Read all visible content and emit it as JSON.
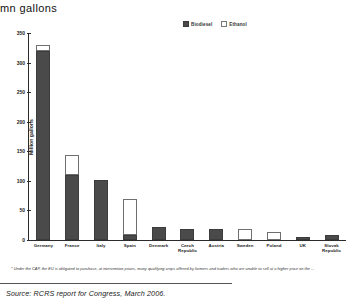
{
  "chart_data": {
    "type": "bar",
    "subtype": "stacked-column",
    "title": "mn gallons",
    "xlabel": "",
    "ylabel": "Million gallons",
    "ylim": [
      0,
      350
    ],
    "yticks": [
      0,
      50,
      100,
      150,
      200,
      250,
      300,
      350
    ],
    "grid": false,
    "legend_position": "top-center",
    "categories": [
      "Germany",
      "France",
      "Italy",
      "Spain",
      "Denmark",
      "Czech Republic",
      "Austria",
      "Sweden",
      "Poland",
      "UK",
      "Slovak Republic"
    ],
    "series": [
      {
        "name": "Biodiesel",
        "color": "#4a4a4a",
        "values": [
          320,
          110,
          102,
          8,
          22,
          18,
          18,
          0,
          0,
          5,
          9
        ]
      },
      {
        "name": "Ethanol",
        "color": "#ffffff",
        "values": [
          10,
          34,
          0,
          62,
          0,
          0,
          0,
          18,
          14,
          0,
          0
        ]
      }
    ],
    "totals": [
      330,
      144,
      102,
      70,
      22,
      18,
      18,
      18,
      14,
      5,
      9
    ],
    "footnote": "* Under the CAP, the EU is obligated to purchase, at intervention prices, many qualifying crops offered by farmers and traders who are unable to sell at a higher price on the ...",
    "source": "Source: RCRS report for Congress, March 2006."
  },
  "legend": {
    "items": [
      {
        "label": "Biodiesel",
        "swatch": "filled-dark-square-icon"
      },
      {
        "label": "Ethanol",
        "swatch": "hollow-white-square-icon"
      }
    ]
  }
}
